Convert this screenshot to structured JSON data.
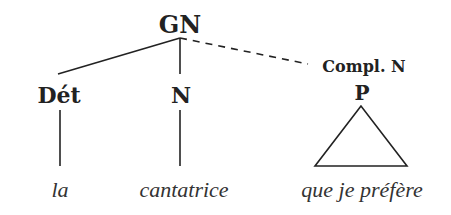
{
  "diagram": {
    "type": "syntax-tree",
    "root": {
      "label": "GN"
    },
    "complement_label": "Compl. N",
    "constituents": [
      {
        "label": "Dét",
        "word": "la",
        "attachment": "line"
      },
      {
        "label": "N",
        "word": "cantatrice",
        "attachment": "line"
      },
      {
        "label": "P",
        "word": "que je préfère",
        "attachment": "triangle"
      }
    ],
    "colors": {
      "ink": "#222222",
      "leaf_ink": "#333333",
      "background": "#ffffff"
    }
  }
}
